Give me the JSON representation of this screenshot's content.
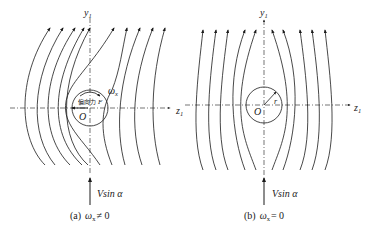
{
  "figure": {
    "panels": [
      {
        "id": "a",
        "axes": {
          "vertical": "y",
          "vertical_sub": "1",
          "horizontal": "z",
          "horizontal_sub": "1"
        },
        "origin_label": "O",
        "rotation_label": "ω",
        "rotation_sub": "x",
        "force_label_cn": "偏向力",
        "force_symbol": "F",
        "flow_label": "Vsin α",
        "caption_prefix": "(a)",
        "caption_math": "ω",
        "caption_sub": "x",
        "caption_rel": "≠ 0",
        "description": "Flow past a rotating cylinder; streamlines deflected to the left, lateral force F toward -z1"
      },
      {
        "id": "b",
        "axes": {
          "vertical": "y",
          "vertical_sub": "1",
          "horizontal": "z",
          "horizontal_sub": "1"
        },
        "origin_label": "O",
        "radius_label": "r",
        "flow_label": "Vsin α",
        "caption_prefix": "(b)",
        "caption_math": "ω",
        "caption_sub": "x",
        "caption_rel": "= 0",
        "description": "Symmetric flow past a non-rotating cylinder"
      }
    ],
    "colors": {
      "line": "#1a1a1a",
      "background": "#ffffff"
    }
  }
}
